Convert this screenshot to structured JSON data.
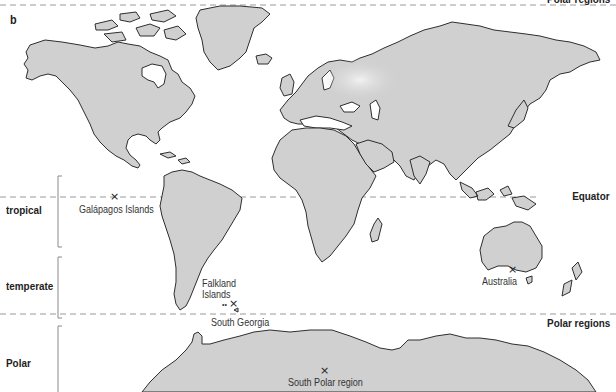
{
  "figure": {
    "panel_label": "b",
    "colors": {
      "land_fill": "#d0d0d0",
      "land_outline": "#2e2e2e",
      "dashed_line": "#9a9a9a",
      "bracket": "#8a8a8a",
      "text": "#2a2a2a",
      "background": "#ffffff"
    }
  },
  "reference_lines": {
    "top_polar": "Polar regions",
    "equator": "Equator",
    "bottom_polar": "Polar regions"
  },
  "zones": [
    {
      "label": "tropical"
    },
    {
      "label": "temperate"
    },
    {
      "label": "Polar"
    }
  ],
  "locations": [
    {
      "name": "Galápagos Islands",
      "marker": "×"
    },
    {
      "name": "Falkland Islands",
      "line1": "Falkland",
      "line2": "Islands",
      "marker": "×"
    },
    {
      "name": "South Georgia"
    },
    {
      "name": "Australia",
      "marker": "×"
    },
    {
      "name": "South Polar region",
      "marker": "×"
    }
  ]
}
